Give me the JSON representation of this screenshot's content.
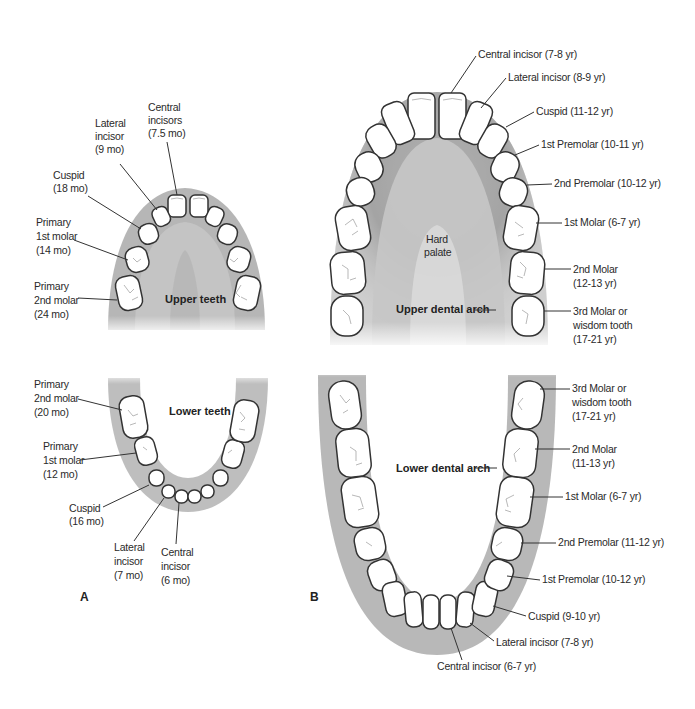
{
  "panel_a": {
    "label": "A",
    "upper": {
      "title": "Upper teeth",
      "labels": [
        {
          "lines": [
            "Central",
            "incisors",
            "(7.5 mo)"
          ]
        },
        {
          "lines": [
            "Lateral",
            "incisor",
            "(9 mo)"
          ]
        },
        {
          "lines": [
            "Cuspid",
            "(18 mo)"
          ]
        },
        {
          "lines": [
            "Primary",
            "1st molar",
            "(14 mo)"
          ]
        },
        {
          "lines": [
            "Primary",
            "2nd molar",
            "(24 mo)"
          ]
        }
      ]
    },
    "lower": {
      "title": "Lower teeth",
      "labels": [
        {
          "lines": [
            "Primary",
            "2nd molar",
            "(20 mo)"
          ]
        },
        {
          "lines": [
            "Primary",
            "1st molar",
            "(12 mo)"
          ]
        },
        {
          "lines": [
            "Cuspid",
            "(16 mo)"
          ]
        },
        {
          "lines": [
            "Lateral",
            "incisor",
            "(7 mo)"
          ]
        },
        {
          "lines": [
            "Central",
            "incisor",
            "(6 mo)"
          ]
        }
      ]
    }
  },
  "panel_b": {
    "label": "B",
    "upper": {
      "arch_label": "Upper dental arch",
      "palate_label": [
        "Hard",
        "palate"
      ],
      "labels": [
        {
          "lines": [
            "Central incisor (7-8 yr)"
          ]
        },
        {
          "lines": [
            "Lateral incisor (8-9 yr)"
          ]
        },
        {
          "lines": [
            "Cuspid (11-12 yr)"
          ]
        },
        {
          "lines": [
            "1st Premolar (10-11 yr)"
          ]
        },
        {
          "lines": [
            "2nd Premolar (10-12 yr)"
          ]
        },
        {
          "lines": [
            "1st Molar (6-7 yr)"
          ]
        },
        {
          "lines": [
            "2nd Molar",
            "(12-13 yr)"
          ]
        },
        {
          "lines": [
            "3rd Molar or",
            "wisdom tooth",
            "(17-21 yr)"
          ]
        }
      ]
    },
    "lower": {
      "arch_label": "Lower dental arch",
      "labels": [
        {
          "lines": [
            "3rd Molar or",
            "wisdom tooth",
            "(17-21 yr)"
          ]
        },
        {
          "lines": [
            "2nd Molar",
            "(11-13 yr)"
          ]
        },
        {
          "lines": [
            "1st Molar (6-7 yr)"
          ]
        },
        {
          "lines": [
            "2nd Premolar (11-12 yr)"
          ]
        },
        {
          "lines": [
            "1st Premolar (10-12 yr)"
          ]
        },
        {
          "lines": [
            "Cuspid (9-10 yr)"
          ]
        },
        {
          "lines": [
            "Lateral incisor (7-8 yr)"
          ]
        },
        {
          "lines": [
            "Central incisor (6-7 yr)"
          ]
        }
      ]
    }
  },
  "colors": {
    "gum_shadow": "#9a9a9a",
    "tooth_fill": "#ffffff",
    "outline": "#333333",
    "text": "#2a2a2a"
  }
}
